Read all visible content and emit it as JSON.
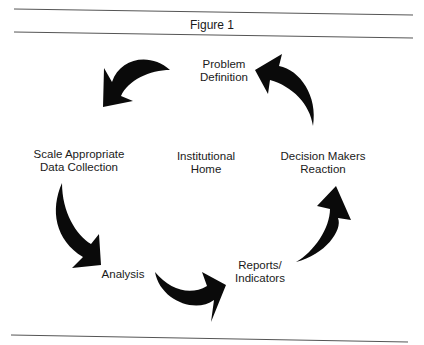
{
  "figure": {
    "title": "Figure 1",
    "center": {
      "line1": "Institutional",
      "line2": "Home"
    },
    "nodes": [
      {
        "id": "problem-definition",
        "line1": "Problem",
        "line2": "Definition"
      },
      {
        "id": "scale-appropriate-data-collection",
        "line1": "Scale Appropriate",
        "line2": "Data Collection"
      },
      {
        "id": "analysis",
        "line1": "Analysis",
        "line2": ""
      },
      {
        "id": "reports-indicators",
        "line1": "Reports/",
        "line2": "Indicators"
      },
      {
        "id": "decision-makers-reaction",
        "line1": "Decision Makers",
        "line2": "Reaction"
      }
    ],
    "cycle_order": [
      "Problem Definition",
      "Scale Appropriate Data Collection",
      "Analysis",
      "Reports/Indicators",
      "Decision Makers Reaction"
    ],
    "colors": {
      "ink": "#0a0a0a",
      "rule": "#555555",
      "background": "#ffffff"
    }
  }
}
